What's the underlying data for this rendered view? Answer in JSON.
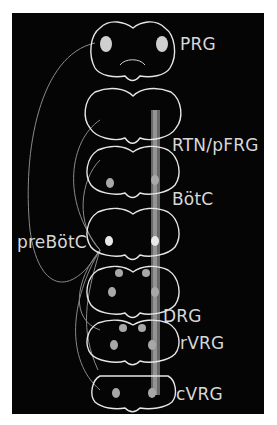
{
  "figure": {
    "background": "#050505",
    "outline_color": "#e6e6e6",
    "nucleus_color": "#c8c8c8",
    "labels": {
      "prg": "PRG",
      "rtn_pfrg": "RTN/pFRG",
      "botc": "BötC",
      "prebotc": "preBötC",
      "drg": "DRG",
      "rvrg": "rVRG",
      "cvrg": "cVRG"
    },
    "sections_count": 7
  }
}
